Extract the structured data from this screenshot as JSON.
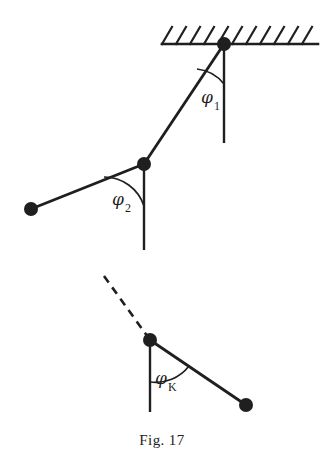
{
  "figure": {
    "caption": "Fig. 17",
    "ink_color": "#1f1f1f",
    "background_color": "#ffffff",
    "angles": [
      {
        "id": "phi1",
        "symbol": "φ",
        "subscript": "1",
        "label_x": 201,
        "label_y": 103,
        "sub_x": 214,
        "sub_y": 110
      },
      {
        "id": "phi2",
        "symbol": "φ",
        "subscript": "2",
        "label_x": 112,
        "label_y": 205,
        "sub_x": 125,
        "sub_y": 212
      },
      {
        "id": "phiK",
        "symbol": "φ",
        "subscript": "K",
        "label_x": 155,
        "label_y": 384,
        "sub_x": 168,
        "sub_y": 391
      }
    ],
    "nodes": [
      {
        "id": "pivot-top",
        "x": 224,
        "y": 44,
        "r": 7
      },
      {
        "id": "joint-middle",
        "x": 144,
        "y": 164,
        "r": 7
      },
      {
        "id": "end-left",
        "x": 31,
        "y": 209,
        "r": 7
      },
      {
        "id": "joint-k",
        "x": 150,
        "y": 340,
        "r": 7
      },
      {
        "id": "end-right",
        "x": 246,
        "y": 405,
        "r": 7
      }
    ],
    "ceiling": {
      "x1": 162,
      "x2": 318,
      "y": 44,
      "hatch_count": 11,
      "hatch_len": 17,
      "hatch_dx": 10
    },
    "links": [
      {
        "id": "link-1",
        "x1": 224,
        "y1": 44,
        "x2": 144,
        "y2": 164
      },
      {
        "id": "link-2",
        "x1": 144,
        "y1": 164,
        "x2": 31,
        "y2": 209
      },
      {
        "id": "link-k",
        "x1": 150,
        "y1": 340,
        "x2": 246,
        "y2": 405
      }
    ],
    "verticals": [
      {
        "id": "vertical-top",
        "x": 224,
        "y1": 44,
        "y2": 143
      },
      {
        "id": "vertical-middle",
        "x": 144,
        "y1": 164,
        "y2": 250
      },
      {
        "id": "vertical-k",
        "x": 150,
        "y1": 340,
        "y2": 412
      }
    ],
    "dashed_line": {
      "id": "dashed-continuation",
      "x1": 104,
      "y1": 276,
      "x2": 150,
      "y2": 340
    },
    "arcs": [
      {
        "id": "arc-phi1",
        "d": "M 224 84 A 40 40 0 0 0 197 69"
      },
      {
        "id": "arc-phi2",
        "d": "M 144 206 A 42 42 0 0 0 104 177"
      },
      {
        "id": "arc-phiK",
        "d": "M 150 382 A 42 42 0 0 0 189 366"
      }
    ]
  }
}
